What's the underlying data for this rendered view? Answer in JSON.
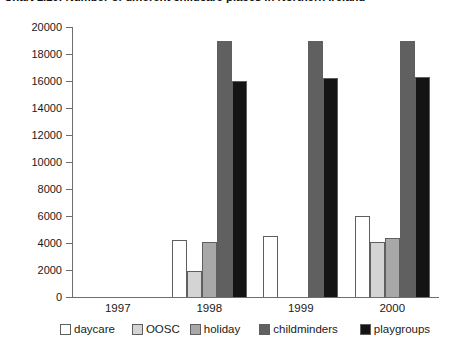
{
  "chart_data": {
    "type": "bar",
    "title": "Chart 1.10: Number of different childcare places in Northern Ireland",
    "xlabel": "",
    "ylabel": "",
    "categories": [
      "1997",
      "1998",
      "1999",
      "2000"
    ],
    "ylim": [
      0,
      20000
    ],
    "ytick_step": 2000,
    "yticks": [
      "0",
      "2000",
      "4000",
      "6000",
      "8000",
      "10000",
      "12000",
      "14000",
      "16000",
      "18000",
      "20000"
    ],
    "grid": false,
    "legend_position": "bottom",
    "series": [
      {
        "name": "daycare",
        "color": "#ffffff",
        "values": [
          null,
          4200,
          4500,
          6000
        ]
      },
      {
        "name": "OOSC",
        "color": "#d4d4d4",
        "values": [
          null,
          1900,
          null,
          4100
        ]
      },
      {
        "name": "holiday",
        "color": "#a8a8a8",
        "values": [
          null,
          4100,
          null,
          4400
        ]
      },
      {
        "name": "childminders",
        "color": "#606060",
        "values": [
          null,
          19000,
          19000,
          19000
        ]
      },
      {
        "name": "playgroups",
        "color": "#141414",
        "values": [
          null,
          16000,
          16200,
          16300
        ]
      }
    ]
  }
}
